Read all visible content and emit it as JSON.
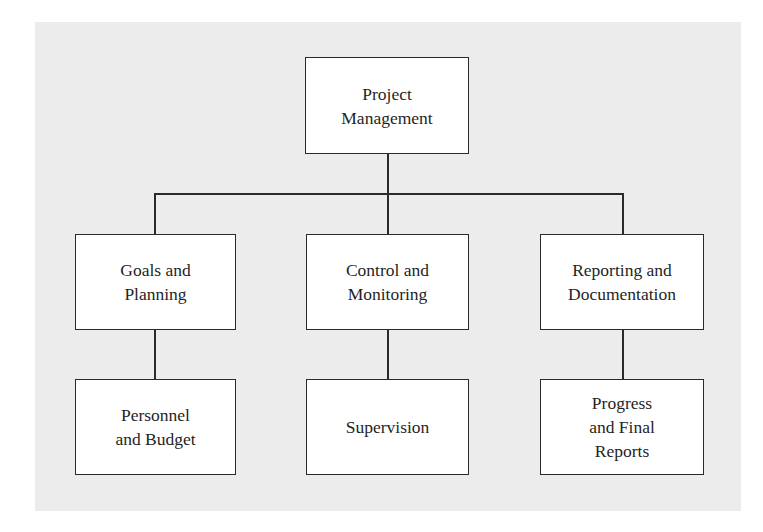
{
  "diagram": {
    "type": "org-chart",
    "root": {
      "label": "Project\nManagement"
    },
    "branches": [
      {
        "label": "Goals and\nPlanning",
        "child": {
          "label": "Personnel\nand Budget"
        }
      },
      {
        "label": "Control and\nMonitoring",
        "child": {
          "label": "Supervision"
        }
      },
      {
        "label": "Reporting and\nDocumentation",
        "child": {
          "label": "Progress\nand Final\nReports"
        }
      }
    ]
  },
  "colors": {
    "background": "#ffffff",
    "panel": "#ececec",
    "box_fill": "#ffffff",
    "line": "#2a2a2a",
    "text": "#1f1f1f"
  }
}
